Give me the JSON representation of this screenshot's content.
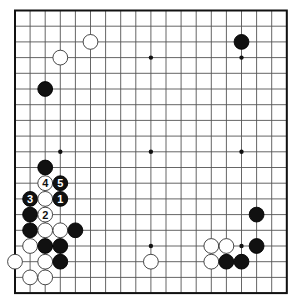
{
  "board": {
    "size": 19,
    "origin_x": 15,
    "origin_y": 10.5,
    "step_x": 15.1,
    "step_y": 15.7,
    "line_color": "#555555",
    "border_color": "#111111",
    "stone_black": "#111111",
    "stone_white": "#ffffff",
    "star_points": [
      [
        3,
        3
      ],
      [
        9,
        3
      ],
      [
        15,
        3
      ],
      [
        3,
        9
      ],
      [
        9,
        9
      ],
      [
        15,
        9
      ],
      [
        3,
        15
      ],
      [
        9,
        15
      ],
      [
        15,
        15
      ]
    ]
  },
  "stones": [
    {
      "color": "white",
      "col": 5,
      "row": 2,
      "label": ""
    },
    {
      "color": "white",
      "col": 3,
      "row": 3,
      "label": ""
    },
    {
      "color": "black",
      "col": 2,
      "row": 5,
      "label": ""
    },
    {
      "color": "black",
      "col": 15,
      "row": 2,
      "label": ""
    },
    {
      "color": "black",
      "col": 2,
      "row": 10,
      "label": ""
    },
    {
      "color": "white",
      "col": 2,
      "row": 11,
      "label": "4"
    },
    {
      "color": "black",
      "col": 3,
      "row": 11,
      "label": "5"
    },
    {
      "color": "black",
      "col": 1,
      "row": 12,
      "label": "3"
    },
    {
      "color": "white",
      "col": 2,
      "row": 12,
      "label": ""
    },
    {
      "color": "black",
      "col": 3,
      "row": 12,
      "label": "1"
    },
    {
      "color": "black",
      "col": 1,
      "row": 13,
      "label": ""
    },
    {
      "color": "white",
      "col": 2,
      "row": 13,
      "label": "2"
    },
    {
      "color": "black",
      "col": 1,
      "row": 14,
      "label": ""
    },
    {
      "color": "white",
      "col": 2,
      "row": 14,
      "label": ""
    },
    {
      "color": "white",
      "col": 3,
      "row": 14,
      "label": ""
    },
    {
      "color": "black",
      "col": 4,
      "row": 14,
      "label": ""
    },
    {
      "color": "white",
      "col": 1,
      "row": 15,
      "label": ""
    },
    {
      "color": "black",
      "col": 2,
      "row": 15,
      "label": ""
    },
    {
      "color": "black",
      "col": 3,
      "row": 15,
      "label": ""
    },
    {
      "color": "white",
      "col": 0,
      "row": 16,
      "label": ""
    },
    {
      "color": "white",
      "col": 2,
      "row": 16,
      "label": ""
    },
    {
      "color": "black",
      "col": 3,
      "row": 16,
      "label": ""
    },
    {
      "color": "white",
      "col": 1,
      "row": 17,
      "label": ""
    },
    {
      "color": "white",
      "col": 2,
      "row": 17,
      "label": ""
    },
    {
      "color": "white",
      "col": 9,
      "row": 16,
      "label": ""
    },
    {
      "color": "black",
      "col": 16,
      "row": 13,
      "label": ""
    },
    {
      "color": "white",
      "col": 13,
      "row": 15,
      "label": ""
    },
    {
      "color": "white",
      "col": 14,
      "row": 15,
      "label": ""
    },
    {
      "color": "black",
      "col": 16,
      "row": 15,
      "label": ""
    },
    {
      "color": "white",
      "col": 13,
      "row": 16,
      "label": ""
    },
    {
      "color": "black",
      "col": 14,
      "row": 16,
      "label": ""
    },
    {
      "color": "black",
      "col": 15,
      "row": 16,
      "label": ""
    }
  ]
}
